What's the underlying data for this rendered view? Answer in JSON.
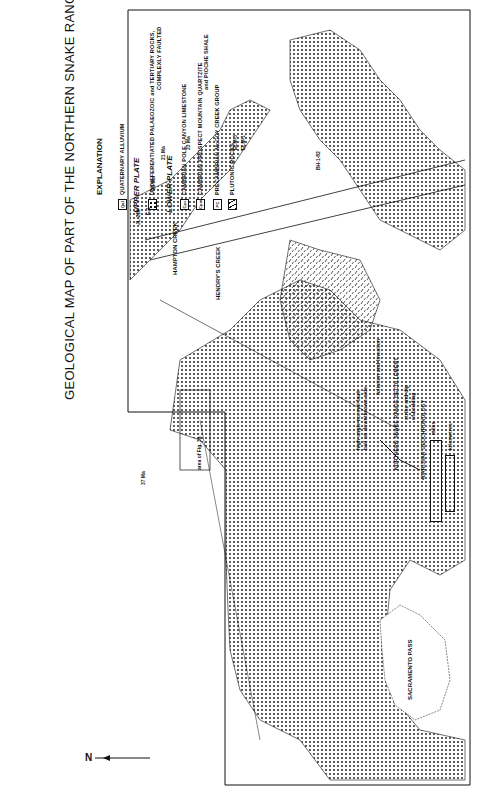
{
  "title": "GEOLOGICAL MAP OF PART OF THE NORTHERN SNAKE RANGE",
  "legend": {
    "heading": "EXPLANATION",
    "items": [
      {
        "code": "Qal",
        "label": "QUATERNARY ALLUVIUM",
        "pattern": "blank"
      },
      {
        "section": "UPPER PLATE"
      },
      {
        "code": "",
        "label": "UNDIFFERENTIATED PALAEOZOIC and TERTIARY ROCKS,",
        "label2": "COMPLEXLY FAULTED",
        "pattern": "dots"
      },
      {
        "section": "LOWER PLATE"
      },
      {
        "code": "Cpc",
        "label": "CAMBRIAN POLE CANYON LIMESTONE",
        "pattern": "blank"
      },
      {
        "code": "Cpm",
        "label": "CAMBRIAN PROSPECT MOUNTAIN QUARTZITE",
        "label2": "and PIOCHE SHALE",
        "pattern": "blank"
      },
      {
        "code": "PC",
        "label": "PRECAMBRIAN McCOY CREEK GROUP",
        "pattern": "blank"
      },
      {
        "code": "",
        "label": "PLUTONIC ROCKS",
        "pattern": "dash"
      }
    ],
    "symbols": {
      "fault": "high-angle normal fault",
      "fault2": "ball on downthrown side",
      "foliation": "foliation and lineation",
      "decollement": "NORTHERN SNAKE RANGE DECOLLEMENT",
      "bedding": "strike and dip",
      "bedding2": "of bedding",
      "geochron": "40AR/39AR GEOCHRONOLOGY"
    },
    "scale": {
      "miles_label": "miles",
      "km_label": "kilometres",
      "ticks_miles": [
        "0",
        "1",
        "2"
      ],
      "ticks_km": [
        "1",
        "0",
        "1",
        "2"
      ]
    }
  },
  "map": {
    "labels": {
      "sacramento_pass": "SACRAMENTO PASS",
      "hampton_creek": "HAMPTON CREEK",
      "hendrys_creek": "HENDRY'S CREEK",
      "area_of_fig": "area of Fig. 3a",
      "age_23a": "23 Ma",
      "age_21": "21 Ma",
      "age_23b": "23 Ma",
      "age_21b": "21 Ma",
      "age_37": "37 Ma",
      "age_25": "25 Ma",
      "sample_jl": "JL-218",
      "sample_e1": "E-1",
      "sample_elm3": "ELM-3",
      "sample_elm1": "ELM-1",
      "sample_bh": "BH-1-82",
      "qal": "Qal"
    },
    "north_label": "N"
  }
}
